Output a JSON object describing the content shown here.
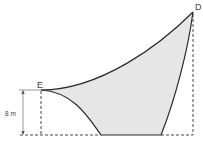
{
  "diagram": {
    "points": {
      "E": {
        "label": "E"
      },
      "D": {
        "label": "D"
      }
    },
    "dimension": {
      "label": "8 m"
    },
    "colors": {
      "fill": "#e6e6e6",
      "stroke": "#2a2a2a",
      "dashed": "#333333",
      "text": "#444444"
    }
  }
}
